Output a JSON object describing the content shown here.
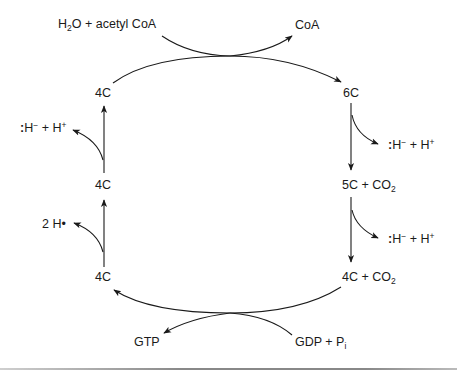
{
  "diagram": {
    "type": "cycle",
    "nodes": {
      "top_left_4c": "4C",
      "six_c": "6C",
      "five_c": "5C + CO",
      "five_c_sub": "2",
      "bottom_right_4c": "4C + CO",
      "bottom_right_4c_sub": "2",
      "bottom_left_4c": "4C",
      "middle_left_4c": "4C"
    },
    "inputs": {
      "water_acetyl": {
        "pre": "H",
        "sub": "2",
        "post": "O + acetyl CoA"
      },
      "gdp": {
        "main": "GDP + P",
        "sub": "i"
      }
    },
    "outputs": {
      "coa": "CoA",
      "gtp": "GTP",
      "hydride_1": {
        "colon": ":",
        "h": "H",
        "minus": "−",
        "plus": " + H",
        "sup_plus": "+"
      },
      "hydride_2": {
        "colon": ":",
        "h": "H",
        "minus": "−",
        "plus": " + H",
        "sup_plus": "+"
      },
      "hydride_3": {
        "colon": ":",
        "h": "H",
        "minus": "−",
        "plus": " + H",
        "sup_plus": "+"
      },
      "two_h": "2 H•"
    },
    "colors": {
      "stroke": "#1a1a1a",
      "background": "#ffffff"
    }
  }
}
